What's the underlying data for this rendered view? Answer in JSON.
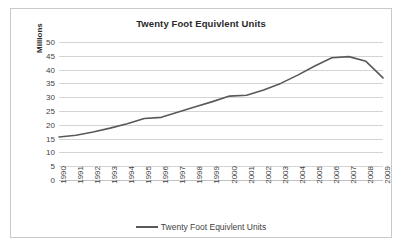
{
  "chart_data": {
    "type": "line",
    "title": "Twenty Foot Equivlent Units",
    "xlabel": "",
    "ylabel": "Millions",
    "ylim": [
      0,
      50
    ],
    "ytick_step": 5,
    "yticks": [
      "50",
      "45",
      "40",
      "35",
      "30",
      "25",
      "20",
      "15",
      "10",
      "5",
      "0"
    ],
    "grid": true,
    "legend_position": "bottom",
    "line_color": "#595959",
    "categories": [
      "1990",
      "1991",
      "1992",
      "1993",
      "1994",
      "1995",
      "1996",
      "1997",
      "1998",
      "1999",
      "2000",
      "2001",
      "2002",
      "2003",
      "2004",
      "2005",
      "2006",
      "2007",
      "2008",
      "2009"
    ],
    "series": [
      {
        "name": "Twenty Foot Equivlent Units",
        "values": [
          15.6,
          16.2,
          17.4,
          18.8,
          20.4,
          22.3,
          22.7,
          24.6,
          26.5,
          28.4,
          30.4,
          30.7,
          32.6,
          35.0,
          38.0,
          41.3,
          44.3,
          44.7,
          43.0,
          37.0
        ]
      }
    ]
  },
  "legend": {
    "items": [
      {
        "label": "Twenty Foot Equivlent Units",
        "color": "#595959"
      }
    ]
  }
}
